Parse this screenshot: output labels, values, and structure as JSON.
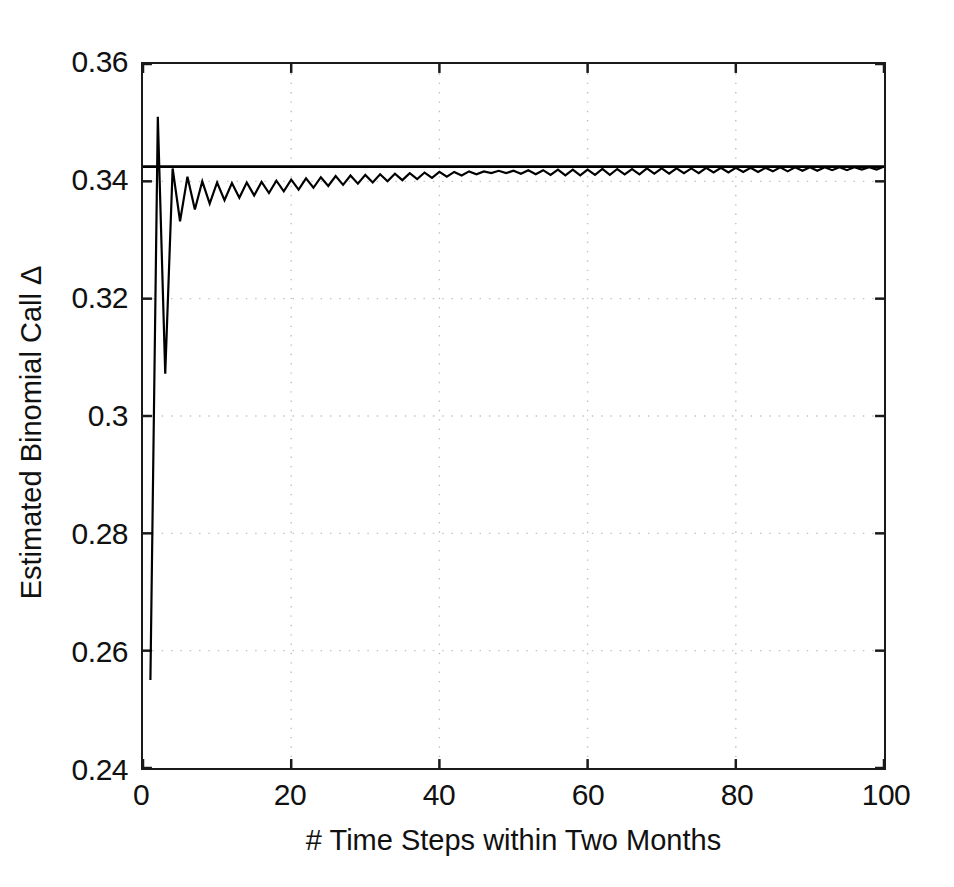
{
  "chart_data": {
    "type": "line",
    "title": "",
    "xlabel": "# Time Steps within Two Months",
    "ylabel": "Estimated Binomial Call Δ",
    "xlim": [
      0,
      100
    ],
    "ylim": [
      0.24,
      0.36
    ],
    "xticks": [
      0,
      20,
      40,
      60,
      80,
      100
    ],
    "xtick_labels": [
      "0",
      "20",
      "40",
      "60",
      "80",
      "100"
    ],
    "yticks": [
      0.24,
      0.26,
      0.28,
      0.3,
      0.32,
      0.34,
      0.36
    ],
    "ytick_labels": [
      "0.24",
      "0.26",
      "0.28",
      "0.3",
      "0.32",
      "0.34",
      "0.36"
    ],
    "grid": true,
    "grid_style": "dotted",
    "grid_color": "#bfbfbf",
    "line_color": "#000000",
    "axis_color": "#1a1a1a",
    "background": "#ffffff",
    "legend": null,
    "annotations": [],
    "series": [
      {
        "name": "Estimated Binomial Call Delta",
        "type": "line",
        "color": "#000000",
        "x": [
          1,
          2,
          3,
          4,
          5,
          6,
          7,
          8,
          9,
          10,
          11,
          12,
          13,
          14,
          15,
          16,
          17,
          18,
          19,
          20,
          21,
          22,
          23,
          24,
          25,
          26,
          27,
          28,
          29,
          30,
          31,
          32,
          33,
          34,
          35,
          36,
          37,
          38,
          39,
          40,
          41,
          42,
          43,
          44,
          45,
          46,
          47,
          48,
          49,
          50,
          51,
          52,
          53,
          54,
          55,
          56,
          57,
          58,
          59,
          60,
          61,
          62,
          63,
          64,
          65,
          66,
          67,
          68,
          69,
          70,
          71,
          72,
          73,
          74,
          75,
          76,
          77,
          78,
          79,
          80,
          81,
          82,
          83,
          84,
          85,
          86,
          87,
          88,
          89,
          90,
          91,
          92,
          93,
          94,
          95,
          96,
          97,
          98,
          99,
          100
        ],
        "y": [
          0.255,
          0.351,
          0.3072,
          0.3422,
          0.3332,
          0.3408,
          0.3352,
          0.34,
          0.3362,
          0.3398,
          0.3368,
          0.3397,
          0.3372,
          0.3398,
          0.3376,
          0.3399,
          0.338,
          0.3401,
          0.3383,
          0.3403,
          0.3386,
          0.3405,
          0.3389,
          0.3407,
          0.3392,
          0.3409,
          0.3394,
          0.341,
          0.3396,
          0.3411,
          0.3398,
          0.3412,
          0.34,
          0.3413,
          0.3402,
          0.3414,
          0.3404,
          0.3415,
          0.3406,
          0.3416,
          0.3408,
          0.3416,
          0.341,
          0.3417,
          0.3412,
          0.3417,
          0.3414,
          0.3418,
          0.3414,
          0.3418,
          0.3413,
          0.3419,
          0.3412,
          0.3419,
          0.3411,
          0.342,
          0.341,
          0.342,
          0.341,
          0.342,
          0.3411,
          0.3421,
          0.3411,
          0.3421,
          0.3412,
          0.3421,
          0.3412,
          0.3422,
          0.3413,
          0.3422,
          0.3413,
          0.3422,
          0.3414,
          0.3422,
          0.3414,
          0.3423,
          0.3415,
          0.3423,
          0.3415,
          0.3423,
          0.3416,
          0.3423,
          0.3416,
          0.3423,
          0.3417,
          0.3424,
          0.3417,
          0.3424,
          0.3418,
          0.3424,
          0.3418,
          0.3424,
          0.3419,
          0.3424,
          0.3419,
          0.3424,
          0.342,
          0.3424,
          0.342,
          0.3425
        ]
      },
      {
        "name": "Black-Scholes Reference Delta",
        "type": "hline",
        "color": "#000000",
        "value": 0.3425
      }
    ]
  }
}
